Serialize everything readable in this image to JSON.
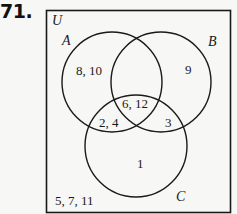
{
  "problem": {
    "number": "71."
  },
  "diagram": {
    "universe_label": "U",
    "sets": [
      {
        "label": "A",
        "cx": 112,
        "cy": 82,
        "r": 50
      },
      {
        "label": "B",
        "cx": 161,
        "cy": 82,
        "r": 50
      },
      {
        "label": "C",
        "cx": 136,
        "cy": 146,
        "r": 51
      }
    ],
    "regions": {
      "A_only": "8, 10",
      "B_only": "9",
      "C_only": "1",
      "A_and_B_and_C": "6, 12",
      "A_and_C_only": "2, 4",
      "B_and_C_only": "3",
      "A_and_B_only": "",
      "outside": "5, 7, 11"
    },
    "colors": {
      "stroke": "#1a1a1a",
      "background": "#f7f7f5"
    }
  }
}
